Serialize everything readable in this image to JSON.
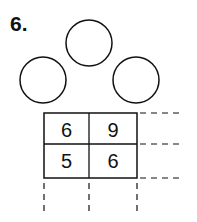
{
  "problem": {
    "number_label": "6.",
    "circles": [
      {
        "position": "top",
        "value": ""
      },
      {
        "position": "left",
        "value": ""
      },
      {
        "position": "right",
        "value": ""
      }
    ],
    "grid": {
      "rows": [
        [
          "6",
          "9"
        ],
        [
          "5",
          "6"
        ]
      ]
    }
  }
}
